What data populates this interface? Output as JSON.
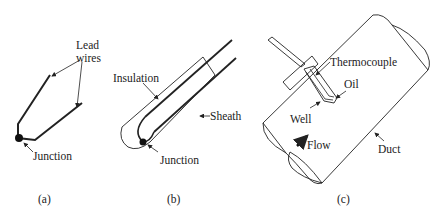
{
  "panels": [
    {
      "id": "a",
      "caption": "(a)",
      "labels": {
        "lead_wires_1": "Lead",
        "lead_wires_2": "wires",
        "junction": "Junction"
      }
    },
    {
      "id": "b",
      "caption": "(b)",
      "labels": {
        "insulation": "Insulation",
        "sheath": "Sheath",
        "junction": "Junction"
      }
    },
    {
      "id": "c",
      "caption": "(c)",
      "labels": {
        "thermocouple": "Thermocouple",
        "oil": "Oil",
        "well": "Well",
        "flow": "Flow",
        "duct": "Duct"
      }
    }
  ]
}
